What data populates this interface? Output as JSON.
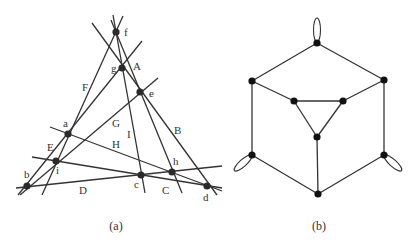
{
  "colors": {
    "background": "#ffffff",
    "line": "#333333",
    "node": "#2a2a2a",
    "text": "#333333"
  },
  "figure_a": {
    "caption": "(a)",
    "caption_pos": [
      116,
      230
    ],
    "nodes": [
      {
        "id": "f",
        "x": 116,
        "y": 32,
        "label": "f",
        "lx": 124,
        "ly": 36
      },
      {
        "id": "g",
        "x": 122,
        "y": 68,
        "label": "g",
        "lx": 111,
        "ly": 72
      },
      {
        "id": "e",
        "x": 140,
        "y": 92,
        "label": "e",
        "lx": 149,
        "ly": 97
      },
      {
        "id": "a",
        "x": 68,
        "y": 134,
        "label": "a",
        "lx": 63,
        "ly": 127
      },
      {
        "id": "i",
        "x": 56,
        "y": 161,
        "label": "i",
        "lx": 56,
        "ly": 174
      },
      {
        "id": "b",
        "x": 27,
        "y": 186,
        "label": "b",
        "lx": 24,
        "ly": 178
      },
      {
        "id": "c",
        "x": 141,
        "y": 175,
        "label": "c",
        "lx": 134,
        "ly": 188
      },
      {
        "id": "h",
        "x": 172,
        "y": 172,
        "label": "h",
        "lx": 173,
        "ly": 165
      },
      {
        "id": "d",
        "x": 207,
        "y": 186,
        "label": "d",
        "lx": 203,
        "ly": 201
      }
    ],
    "lines": [
      {
        "id": "F",
        "x1": 123,
        "y1": 16,
        "x2": 42,
        "y2": 195,
        "label": "F",
        "lx": 82,
        "ly": 91
      },
      {
        "id": "I",
        "x1": 113,
        "y1": 15,
        "x2": 145,
        "y2": 193,
        "label": "I",
        "lx": 127,
        "ly": 138
      },
      {
        "id": "C",
        "x1": 111,
        "y1": 20,
        "x2": 182,
        "y2": 193,
        "label": "C",
        "lx": 162,
        "ly": 194
      },
      {
        "id": "A",
        "x1": 92,
        "y1": 23,
        "x2": 217,
        "y2": 195,
        "label": "A",
        "lx": 133,
        "ly": 70
      },
      {
        "id": "B",
        "x1": 142,
        "y1": 41,
        "x2": 18,
        "y2": 195,
        "label": "B",
        "lx": 174,
        "ly": 134
      },
      {
        "id": "G",
        "x1": 158,
        "y1": 78,
        "x2": 20,
        "y2": 195,
        "label": "G",
        "lx": 112,
        "ly": 127
      },
      {
        "id": "H",
        "x1": 50,
        "y1": 127,
        "x2": 222,
        "y2": 191,
        "label": "H",
        "lx": 112,
        "ly": 148
      },
      {
        "id": "E",
        "x1": 32,
        "y1": 157,
        "x2": 222,
        "y2": 188,
        "label": "E",
        "lx": 47,
        "ly": 151
      },
      {
        "id": "D",
        "x1": 16,
        "y1": 188,
        "x2": 222,
        "y2": 166,
        "label": "D",
        "lx": 79,
        "ly": 194
      }
    ]
  },
  "figure_b": {
    "caption": "(b)",
    "caption_pos": [
      319,
      230
    ],
    "nodes": [
      {
        "id": "top",
        "x": 317,
        "y": 43
      },
      {
        "id": "upper-left",
        "x": 252,
        "y": 81
      },
      {
        "id": "upper-right",
        "x": 384,
        "y": 80
      },
      {
        "id": "inner-left",
        "x": 294,
        "y": 101
      },
      {
        "id": "inner-right",
        "x": 343,
        "y": 101
      },
      {
        "id": "inner-bottom",
        "x": 317,
        "y": 137
      },
      {
        "id": "lower-left",
        "x": 252,
        "y": 155
      },
      {
        "id": "lower-right",
        "x": 384,
        "y": 155
      },
      {
        "id": "bottom",
        "x": 318,
        "y": 194
      }
    ],
    "edges": [
      [
        "top",
        "upper-left"
      ],
      [
        "top",
        "upper-right"
      ],
      [
        "upper-left",
        "inner-left"
      ],
      [
        "upper-right",
        "inner-right"
      ],
      [
        "inner-left",
        "inner-right"
      ],
      [
        "inner-left",
        "inner-bottom"
      ],
      [
        "inner-right",
        "inner-bottom"
      ],
      [
        "inner-bottom",
        "bottom"
      ],
      [
        "upper-left",
        "lower-left"
      ],
      [
        "upper-right",
        "lower-right"
      ],
      [
        "lower-left",
        "bottom"
      ],
      [
        "lower-right",
        "bottom"
      ]
    ],
    "loops": [
      {
        "node": "top",
        "cx": 317,
        "cy": 30,
        "rx": 3.5,
        "ry": 12,
        "rotate": 0
      },
      {
        "node": "lower-left",
        "cx": 243,
        "cy": 163,
        "rx": 3.5,
        "ry": 11.5,
        "rotate": 48
      },
      {
        "node": "lower-right",
        "cx": 393,
        "cy": 163,
        "rx": 3.5,
        "ry": 11.5,
        "rotate": -48
      }
    ]
  }
}
